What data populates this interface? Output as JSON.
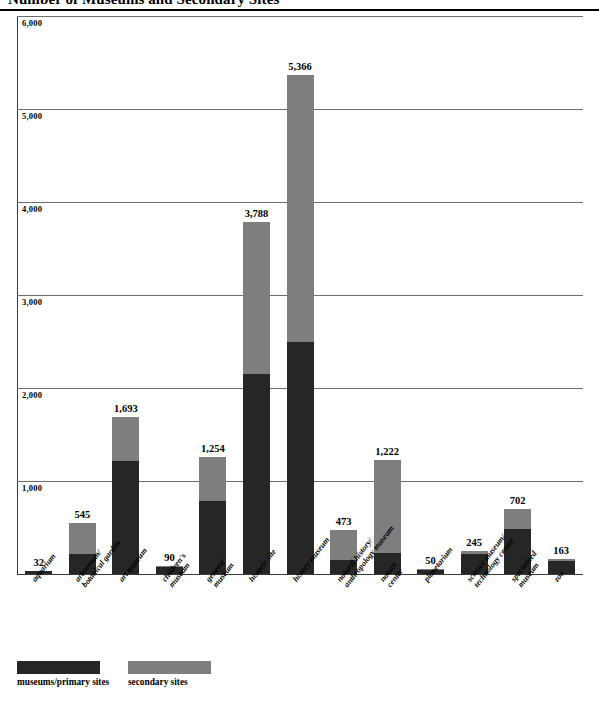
{
  "chart_data": {
    "type": "bar",
    "subtype": "stacked-bar",
    "title": "Number of Museums and Secondary Sites",
    "xlabel": "",
    "ylabel": "",
    "ylim": [
      0,
      6000
    ],
    "ytick_labels": [
      "6,000",
      "5,000",
      "4,000",
      "3,000",
      "2,000",
      "1,000"
    ],
    "ytick_values": [
      6000,
      5000,
      4000,
      3000,
      2000,
      1000
    ],
    "grid": true,
    "legend_position": "bottom-left",
    "categories": [
      "aquarium",
      "arboretum/\nbotanical garden",
      "art museum",
      "children's\nmuseum",
      "general\nmuseum",
      "historic site",
      "history museum",
      "natural history/\nanthropology museum",
      "nature\ncenter",
      "planetarium",
      "science museum/\ntechnology center",
      "specialized\nmuseum",
      "zoo"
    ],
    "series": [
      {
        "name": "museums/primary sites",
        "color": "#262626",
        "values": [
          28,
          210,
          1210,
          78,
          790,
          2150,
          2500,
          150,
          230,
          44,
          215,
          480,
          140
        ]
      },
      {
        "name": "secondary sites",
        "color": "#7e7e7e",
        "values": [
          4,
          335,
          483,
          12,
          464,
          1638,
          2866,
          323,
          992,
          6,
          30,
          222,
          23
        ]
      }
    ],
    "totals": [
      32,
      545,
      1693,
      90,
      1254,
      3788,
      5366,
      473,
      1222,
      50,
      245,
      702,
      163
    ],
    "total_labels": [
      "32",
      "545",
      "1,693",
      "90",
      "1,254",
      "3,788",
      "5,366",
      "473",
      "1,222",
      "50",
      "245",
      "702",
      "163"
    ]
  },
  "legend": {
    "items": [
      {
        "label": "museums/primary sites",
        "color": "#262626"
      },
      {
        "label": "secondary sites",
        "color": "#7e7e7e"
      }
    ]
  }
}
